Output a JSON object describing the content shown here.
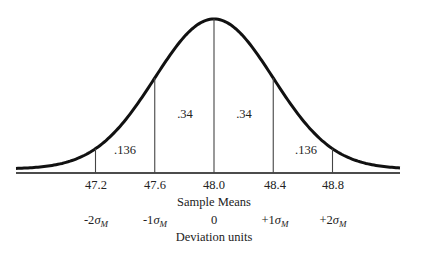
{
  "chart_data": {
    "type": "area",
    "title": "",
    "x": [
      47.2,
      47.6,
      48.0,
      48.4,
      48.8
    ],
    "tick_labels": [
      "47.2",
      "47.6",
      "48.0",
      "48.4",
      "48.8"
    ],
    "xlabel": "Sample Means",
    "deviation_tick_labels": [
      "-2σM",
      "-1σM",
      "0",
      "+1σM",
      "+2σM"
    ],
    "deviation_label": "Deviation units",
    "mean": 48.0,
    "standard_error": 0.4,
    "regions": [
      {
        "from": 47.2,
        "to": 47.6,
        "area": ".136"
      },
      {
        "from": 47.6,
        "to": 48.0,
        "area": ".34"
      },
      {
        "from": 48.0,
        "to": 48.4,
        "area": ".34"
      },
      {
        "from": 48.4,
        "to": 48.8,
        "area": ".136"
      }
    ],
    "grid": false,
    "legend": null
  },
  "labels": {
    "ticks": [
      "47.2",
      "47.6",
      "48.0",
      "48.4",
      "48.8"
    ],
    "xlabel": "Sample Means",
    "dev": [
      {
        "sign": "-2",
        "sym": "σ",
        "sub": "M"
      },
      {
        "sign": "-1",
        "sym": "σ",
        "sub": "M"
      },
      {
        "sign": "0",
        "sym": "",
        "sub": ""
      },
      {
        "sign": "+1",
        "sym": "σ",
        "sub": "M"
      },
      {
        "sign": "+2",
        "sym": "σ",
        "sub": "M"
      }
    ],
    "devlabel": "Deviation units",
    "areas": [
      ".136",
      ".34",
      ".34",
      ".136"
    ]
  }
}
